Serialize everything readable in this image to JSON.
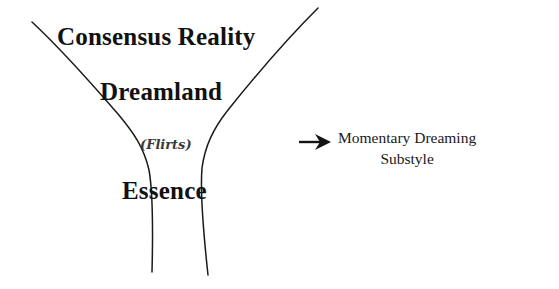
{
  "diagram": {
    "type": "funnel-hourglass-levels",
    "background_color": "#ffffff",
    "stroke_color": "#1a1a1a",
    "levels": [
      {
        "id": "consensus-reality",
        "label": "Consensus Reality"
      },
      {
        "id": "dreamland",
        "label": "Dreamland"
      },
      {
        "id": "flirts",
        "label": "(Flirts)"
      },
      {
        "id": "essence",
        "label": "Essence"
      }
    ],
    "annotation": {
      "arrow_icon": "right-arrow-icon",
      "line1": "Momentary Dreaming",
      "line2": "Substyle"
    }
  }
}
